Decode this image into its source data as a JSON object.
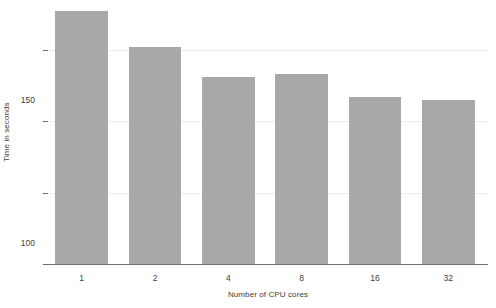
{
  "chart_data": {
    "type": "bar",
    "title": "",
    "subtitle": "",
    "xlabel": "Number of CPU cores",
    "ylabel": "Time in seconds",
    "categories": [
      "1",
      "2",
      "4",
      "8",
      "16",
      "32"
    ],
    "values": [
      177,
      152,
      131,
      133,
      117,
      115
    ],
    "series": [
      {
        "name": "Time in seconds",
        "values": [
          177,
          152,
          131,
          133,
          117,
          115
        ]
      }
    ],
    "ylim": [
      0,
      185
    ],
    "xlim": [
      0,
      6
    ],
    "yticks": [
      "0",
      "50",
      "100",
      "150"
    ],
    "ytick_values": [
      0,
      50,
      100,
      150
    ],
    "grid": "horizontal",
    "legend": "none",
    "bar_color": "#a8a8a8",
    "gridline_color": "#ededed",
    "axis_color": "#6f6f6f",
    "background_color": "#ffffff",
    "text_color": "#3d3d3d"
  }
}
